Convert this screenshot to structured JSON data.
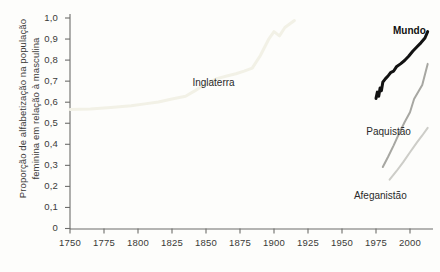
{
  "figure": {
    "background_color": "#fdfdfb",
    "axis_color": "#6d6d6b",
    "text_color": "#3a3a38"
  },
  "chart_data": {
    "type": "line",
    "title": "",
    "xlabel": "",
    "ylabel": "Proporção de alfabetização na população feminina em relação à masculina",
    "xlim": [
      1750,
      2013
    ],
    "ylim": [
      0,
      1.0
    ],
    "grid": false,
    "legend_position": "inline-labels",
    "y_tick_labels": [
      "0",
      "0,1",
      "0,2",
      "0,3",
      "0,4",
      "0,5",
      "0,6",
      "0,7",
      "0,8",
      "0,9",
      "1,0"
    ],
    "y_tick_values": [
      0,
      0.1,
      0.2,
      0.3,
      0.4,
      0.5,
      0.6,
      0.7,
      0.8,
      0.9,
      1.0
    ],
    "x_tick_labels": [
      "1750",
      "1775",
      "1800",
      "1825",
      "1850",
      "1875",
      "1900",
      "1925",
      "1950",
      "1975",
      "2000"
    ],
    "x_tick_values": [
      1750,
      1775,
      1800,
      1825,
      1850,
      1875,
      1900,
      1925,
      1950,
      1975,
      2000
    ],
    "series": [
      {
        "name": "Inglaterra",
        "color": "#f2f1e6",
        "width": 3.0,
        "label_x": 1840,
        "label_y": 0.685,
        "bold": false,
        "x": [
          1750,
          1765,
          1780,
          1795,
          1805,
          1815,
          1825,
          1835,
          1842,
          1850,
          1858,
          1866,
          1872,
          1878,
          1884,
          1890,
          1896,
          1900,
          1904,
          1908,
          1915
        ],
        "y": [
          0.565,
          0.568,
          0.575,
          0.583,
          0.592,
          0.601,
          0.615,
          0.628,
          0.655,
          0.688,
          0.712,
          0.726,
          0.735,
          0.748,
          0.762,
          0.822,
          0.898,
          0.935,
          0.915,
          0.955,
          0.988
        ]
      },
      {
        "name": "Mundo",
        "color": "#121212",
        "width": 3.0,
        "label_x": 1966,
        "label_y": 0.935,
        "bold": true,
        "x": [
          1975,
          1976,
          1977,
          1978,
          1979,
          1980,
          1982,
          1984,
          1986,
          1988,
          1990,
          1993,
          1996,
          1999,
          2002,
          2005,
          2008,
          2011,
          2013
        ],
        "y": [
          0.618,
          0.648,
          0.628,
          0.668,
          0.655,
          0.695,
          0.712,
          0.726,
          0.742,
          0.748,
          0.768,
          0.782,
          0.798,
          0.818,
          0.842,
          0.862,
          0.882,
          0.905,
          0.935
        ]
      },
      {
        "name": "Paquistão",
        "color": "#a7a7a2",
        "width": 2.0,
        "label_x": 1955,
        "label_y": 0.452,
        "bold": false,
        "x": [
          1980,
          1984,
          1988,
          1992,
          1996,
          2000,
          2003,
          2006,
          2009,
          2011,
          2013
        ],
        "y": [
          0.292,
          0.342,
          0.395,
          0.452,
          0.505,
          0.552,
          0.615,
          0.648,
          0.682,
          0.732,
          0.782
        ]
      },
      {
        "name": "Afeganistão",
        "color": "#cdcdc8",
        "width": 2.0,
        "label_x": 1952,
        "label_y": 0.152,
        "bold": false,
        "x": [
          1985,
          1990,
          1995,
          2000,
          2005,
          2009,
          2013
        ],
        "y": [
          0.232,
          0.272,
          0.315,
          0.362,
          0.408,
          0.442,
          0.478
        ]
      }
    ]
  }
}
